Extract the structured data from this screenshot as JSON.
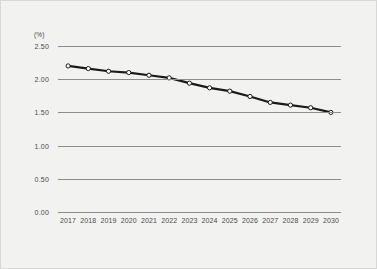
{
  "chart_data": {
    "type": "line",
    "title": "",
    "subtitle": "",
    "xlabel": "",
    "ylabel": "",
    "unit_label": "(%)",
    "categories": [
      "2017",
      "2018",
      "2019",
      "2020",
      "2021",
      "2022",
      "2023",
      "2024",
      "2025",
      "2026",
      "2027",
      "2028",
      "2029",
      "2030"
    ],
    "values": [
      2.2,
      2.16,
      2.12,
      2.1,
      2.06,
      2.02,
      1.94,
      1.87,
      1.82,
      1.74,
      1.65,
      1.61,
      1.57,
      1.5
    ],
    "series": [
      {
        "name": "",
        "values": [
          2.2,
          2.16,
          2.12,
          2.1,
          2.06,
          2.02,
          1.94,
          1.87,
          1.82,
          1.74,
          1.65,
          1.61,
          1.57,
          1.5
        ]
      }
    ],
    "ylim": [
      0.0,
      2.5
    ],
    "yticks": [
      0.0,
      0.5,
      1.0,
      1.5,
      2.0,
      2.5
    ],
    "ytick_labels": [
      "0.00",
      "0.50",
      "1.00",
      "1.50",
      "2.00",
      "2.50"
    ],
    "grid": true,
    "grid_axis": "y",
    "legend": false,
    "legend_position": "none",
    "marker": "circle-open",
    "colors": {
      "line": "#1a1a1a",
      "marker_fill": "#ffffff",
      "gridline": "#8d8d8d",
      "text": "#4a4a4a",
      "background": "#f2f2f0"
    }
  }
}
